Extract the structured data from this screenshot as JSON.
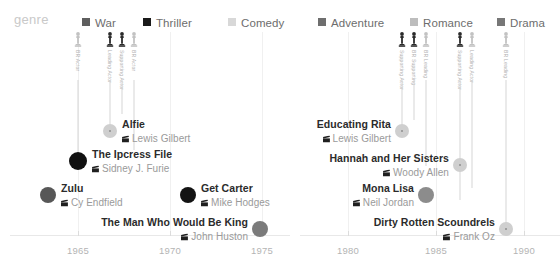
{
  "legend": {
    "title": "genre",
    "items": [
      {
        "label": "War",
        "color": "#5e5e5e",
        "x": 82
      },
      {
        "label": "Thriller",
        "color": "#1a1a1a",
        "x": 143
      },
      {
        "label": "Comedy",
        "color": "#d8d8d8",
        "x": 228
      },
      {
        "label": "Adventure",
        "color": "#6e6e6e",
        "x": 318
      },
      {
        "label": "Romance",
        "color": "#bdbdbd",
        "x": 410
      },
      {
        "label": "Drama",
        "color": "#777777",
        "x": 497
      }
    ]
  },
  "chart_data": {
    "type": "scatter",
    "title": "",
    "xlabel": "",
    "ylabel": "",
    "panels": [
      {
        "name": "panel-left",
        "x": 10,
        "width": 280,
        "axis": {
          "ticks": [
            {
              "label": "1965",
              "x": 68
            },
            {
              "label": "1970",
              "x": 160
            },
            {
              "label": "1975",
              "x": 252
            }
          ],
          "range": [
            1963,
            1977
          ]
        },
        "gridlines": [
          68,
          160,
          252
        ],
        "awards": [
          {
            "x": 68,
            "type": "nomination",
            "label": "BR Actor",
            "line_top": 14,
            "line_height": 76
          },
          {
            "x": 100,
            "type": "win",
            "label": "Leading Actor",
            "line_top": 14,
            "line_height": 46
          },
          {
            "x": 112,
            "type": "win",
            "label": "Supporting Actor",
            "line_top": 14,
            "line_height": 34
          },
          {
            "x": 124,
            "type": "nomination",
            "label": "BR Actor",
            "line_top": 14,
            "line_height": 70
          }
        ],
        "films": [
          {
            "title": "Alfie",
            "director": "Lewis Gilbert",
            "genre": "Comedy",
            "color": "#cfcfcf",
            "dot_x": 100,
            "dot_r": 7,
            "y": 86,
            "align": "left",
            "hollow": true
          },
          {
            "title": "The Ipcress File",
            "director": "Sidney J. Furie",
            "genre": "Thriller",
            "color": "#111111",
            "dot_x": 68,
            "dot_r": 9,
            "y": 116,
            "align": "left",
            "hollow": false
          },
          {
            "title": "Zulu",
            "director": "Cy Endfield",
            "genre": "War",
            "color": "#575757",
            "dot_x": 38,
            "dot_r": 8,
            "y": 150,
            "align": "left",
            "hollow": false
          },
          {
            "title": "Get Carter",
            "director": "Mike Hodges",
            "genre": "Thriller",
            "color": "#131313",
            "dot_x": 178,
            "dot_r": 8,
            "y": 150,
            "align": "left",
            "hollow": false
          },
          {
            "title": "The Man Who Would Be King",
            "director": "John Huston",
            "genre": "Adventure",
            "color": "#7b7b7b",
            "dot_x": 250,
            "dot_r": 8,
            "y": 184,
            "align": "right",
            "hollow": false
          }
        ]
      },
      {
        "name": "panel-right",
        "x": 300,
        "width": 260,
        "axis": {
          "ticks": [
            {
              "label": "1980",
              "x": 48
            },
            {
              "label": "1985",
              "x": 136
            },
            {
              "label": "1990",
              "x": 224
            }
          ],
          "range": [
            1978,
            1992
          ]
        },
        "gridlines": [
          48,
          136,
          224
        ],
        "awards": [
          {
            "x": 102,
            "type": "win",
            "label": "Supporting Actor",
            "line_top": 14,
            "line_height": 52
          },
          {
            "x": 114,
            "type": "win",
            "label": "BR Supporting",
            "line_top": 14,
            "line_height": 40
          },
          {
            "x": 126,
            "type": "nomination",
            "label": "BR Leading",
            "line_top": 14,
            "line_height": 86
          },
          {
            "x": 160,
            "type": "win",
            "label": "Supporting Actor",
            "line_top": 14,
            "line_height": 120
          },
          {
            "x": 172,
            "type": "nomination",
            "label": "Leading Actor",
            "line_top": 14,
            "line_height": 108
          },
          {
            "x": 206,
            "type": "nomination",
            "label": "BR Leading",
            "line_top": 14,
            "line_height": 148
          }
        ],
        "films": [
          {
            "title": "Educating Rita",
            "director": "Lewis Gilbert",
            "genre": "Comedy",
            "color": "#cfcfcf",
            "dot_x": 102,
            "dot_r": 7,
            "y": 86,
            "align": "right",
            "hollow": true
          },
          {
            "title": "Hannah and Her Sisters",
            "director": "Woody Allen",
            "genre": "Comedy",
            "color": "#cfcfcf",
            "dot_x": 160,
            "dot_r": 7,
            "y": 120,
            "align": "right",
            "hollow": true
          },
          {
            "title": "Mona Lisa",
            "director": "Neil Jordan",
            "genre": "Drama",
            "color": "#8c8c8c",
            "dot_x": 126,
            "dot_r": 8,
            "y": 150,
            "align": "right",
            "hollow": false
          },
          {
            "title": "Dirty Rotten Scoundrels",
            "director": "Frank Oz",
            "genre": "Comedy",
            "color": "#cfcfcf",
            "dot_x": 206,
            "dot_r": 7,
            "y": 184,
            "align": "right",
            "hollow": true
          }
        ]
      }
    ]
  }
}
